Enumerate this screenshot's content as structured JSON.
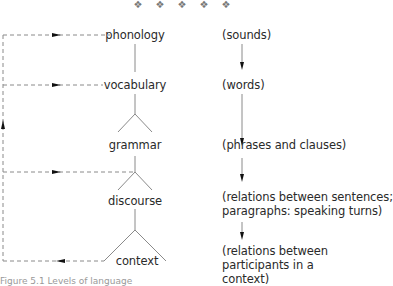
{
  "ornaments": [
    "❖",
    "❖",
    "❖",
    "❖",
    "❖"
  ],
  "levels": [
    {
      "label": "phonology",
      "description": "(sounds)"
    },
    {
      "label": "vocabulary",
      "description": "(words)"
    },
    {
      "label": "grammar",
      "description": "(phrases and clauses)"
    },
    {
      "label": "discourse",
      "description_lines": [
        "(relations between sentences;",
        "paragraphs: speaking turns)"
      ]
    },
    {
      "label": "context",
      "description_lines": [
        "(relations between",
        "participants in a",
        "context)"
      ]
    }
  ],
  "caption": "Figure 5.1   Levels of language",
  "colors": {
    "line": "#8a8a8a",
    "dashed": "#8a8a8a",
    "arrow": "#111111",
    "text": "#2a2a2a"
  }
}
